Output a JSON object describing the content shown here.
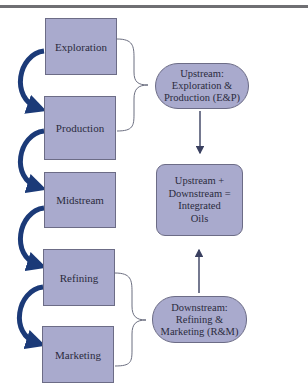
{
  "diagram": {
    "stages": [
      {
        "label": "Exploration"
      },
      {
        "label": "Production"
      },
      {
        "label": "Midstream"
      },
      {
        "label": "Refining"
      },
      {
        "label": "Marketing"
      }
    ],
    "upstream": {
      "lines": [
        "Upstream:",
        "Exploration &",
        "Production (E&P)"
      ]
    },
    "integrated": {
      "lines": [
        "Upstream +",
        "Downstream =",
        "Integrated",
        "Oils"
      ]
    },
    "downstream": {
      "lines": [
        "Downstream:",
        "Refining &",
        "Marketing (R&M)"
      ]
    },
    "colors": {
      "box_fill": "#a9aacd",
      "box_border": "#6c6c86",
      "curved_arrow": "#1b3a78",
      "connector": "#4a4f66",
      "brace": "#6b6e80"
    }
  }
}
